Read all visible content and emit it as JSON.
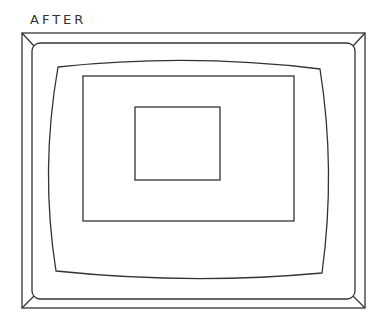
{
  "diagram": {
    "label": "AFTER",
    "stroke_color": "#333333",
    "background": "#ffffff"
  }
}
